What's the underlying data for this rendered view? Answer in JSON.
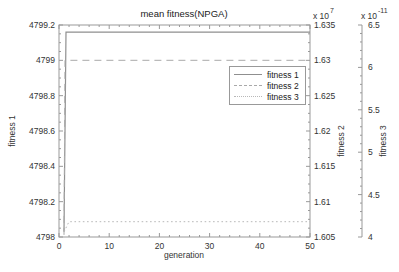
{
  "chart_data": {
    "type": "line",
    "title": "mean fitness(NPGA)",
    "xlabel": "generation",
    "grid": false,
    "legend_position": "upper right inside",
    "frame_color": "#999999",
    "axes": {
      "x": {
        "label": "generation",
        "tick_labels": [
          "0",
          "10",
          "20",
          "30",
          "40",
          "50"
        ],
        "lim": [
          0,
          50
        ],
        "minor_step": 2
      },
      "y1": {
        "label": "fitness 1",
        "side": "left",
        "tick_labels": [
          "4798",
          "4798.2",
          "4798.4",
          "4798.6",
          "4798.8",
          "4799",
          "4799.2"
        ],
        "lim": [
          4798,
          4799.2
        ],
        "minor_step": 0.05
      },
      "y2": {
        "label": "fitness 2",
        "side": "right",
        "multiplier_base": "x 10",
        "multiplier_exp": "7",
        "tick_labels": [
          "1.605",
          "1.61",
          "1.615",
          "1.62",
          "1.625",
          "1.63",
          "1.635"
        ],
        "lim": [
          1.605,
          1.635
        ]
      },
      "y3": {
        "label": "fitness 3",
        "side": "far-right",
        "multiplier_base": "x 10",
        "multiplier_exp": "-11",
        "tick_labels": [
          "4",
          "4.5",
          "5",
          "5.5",
          "6",
          "6.5"
        ],
        "lim": [
          4,
          6.5
        ],
        "minor_step": 0.1
      }
    },
    "series": [
      {
        "name": "fitness 1",
        "axis": "y1",
        "line_style": "solid",
        "color": "#8f8f8f",
        "points": [
          [
            1,
            4798.03
          ],
          [
            1.4,
            4799.16
          ],
          [
            50,
            4799.16
          ]
        ],
        "converged_value": 4799.16
      },
      {
        "name": "fitness 2",
        "axis": "y2",
        "line_style": "dashed",
        "color": "#a9a9a9",
        "unit_multiplier": "1e7",
        "points": [
          [
            1,
            1.6053
          ],
          [
            1.2,
            1.63
          ],
          [
            50,
            1.63
          ]
        ],
        "converged_value": 1.63
      },
      {
        "name": "fitness 3",
        "axis": "y3",
        "line_style": "dotted",
        "color": "#b8b8b8",
        "unit_multiplier": "1e-11",
        "points": [
          [
            1,
            4.06
          ],
          [
            2,
            4.18
          ],
          [
            50,
            4.18
          ]
        ],
        "converged_value": 4.18
      }
    ]
  }
}
